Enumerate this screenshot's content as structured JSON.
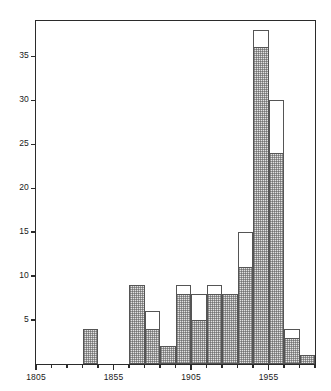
{
  "chart_data": {
    "type": "bar",
    "title": "",
    "subtitle": "",
    "xlabel": "",
    "ylabel": "",
    "grid": false,
    "legend": "none",
    "bin_width": 10,
    "xlim": [
      1805,
      1985
    ],
    "ylim": [
      0,
      39
    ],
    "x_ticks": [
      1805,
      1815,
      1825,
      1835,
      1845,
      1855,
      1865,
      1875,
      1885,
      1895,
      1905,
      1915,
      1925,
      1935,
      1945,
      1955,
      1965,
      1975,
      1985
    ],
    "x_tick_labels": [
      "1805",
      "",
      "",
      "",
      "",
      "1855",
      "",
      "",
      "",
      "",
      "1905",
      "",
      "",
      "",
      "",
      "1955",
      "",
      "",
      ""
    ],
    "x_labeled_ticks": [
      {
        "value": 1805,
        "label": "1805"
      },
      {
        "value": 1855,
        "label": "1855"
      },
      {
        "value": 1905,
        "label": "1905"
      },
      {
        "value": 1955,
        "label": "1955"
      }
    ],
    "y_ticks": [
      5,
      10,
      15,
      20,
      25,
      30,
      35
    ],
    "y_tick_labels": [
      "5",
      "10",
      "15",
      "20",
      "25",
      "30",
      "35"
    ],
    "categories": [
      "1805-1815",
      "1815-1825",
      "1825-1835",
      "1835-1845",
      "1845-1855",
      "1855-1865",
      "1865-1875",
      "1875-1885",
      "1885-1895",
      "1895-1905",
      "1905-1915",
      "1915-1925",
      "1925-1935",
      "1935-1945",
      "1945-1955",
      "1955-1965",
      "1965-1975",
      "1975-1985"
    ],
    "bin_starts": [
      1805,
      1815,
      1825,
      1835,
      1845,
      1855,
      1865,
      1875,
      1885,
      1895,
      1905,
      1915,
      1925,
      1935,
      1945,
      1955,
      1965,
      1975
    ],
    "series": [
      {
        "name": "filled",
        "style": "filled",
        "values": [
          0,
          0,
          0,
          4,
          0,
          0,
          9,
          4,
          2,
          8,
          5,
          8,
          8,
          11,
          36,
          24,
          3,
          1
        ]
      },
      {
        "name": "outline",
        "style": "outline",
        "values": [
          0,
          0,
          0,
          4,
          0,
          0,
          9,
          6,
          2,
          9,
          8,
          9,
          8,
          15,
          38,
          30,
          4,
          1
        ]
      }
    ],
    "colors": {
      "axis": "#2b2b2b",
      "bar_border": "#555555",
      "bar_fill": "#e3e3e3",
      "background": "#ffffff"
    }
  }
}
